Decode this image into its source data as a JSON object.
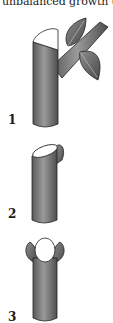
{
  "caption": {
    "text": "unbalanced growth (4)."
  },
  "figures": [
    {
      "label": "1",
      "description": "stem with slanted cut just above side branch bearing two leaves"
    },
    {
      "label": "2",
      "description": "stem with slanted cut above a bud"
    },
    {
      "label": "3",
      "description": "stem with flat cut between two opposite buds"
    }
  ],
  "colors": {
    "bark": "#8a8a8a",
    "bark_dark": "#4a4a4a",
    "cut_surface": "#ffffff",
    "outline": "#222222"
  }
}
